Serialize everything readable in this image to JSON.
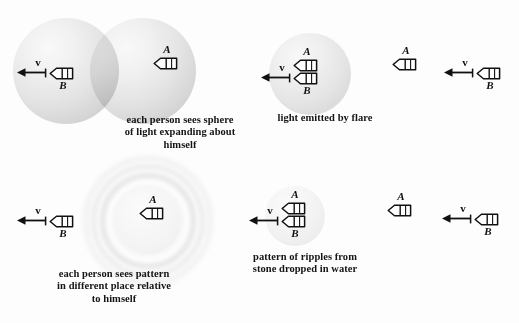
{
  "figure": {
    "background_color": "#fdfdfd",
    "ink_color": "#111111",
    "sphere_color": "#e3e3e3"
  },
  "panels": {
    "top_left": {
      "caption": "each person sees sphere\nof light expanding about\nhimself",
      "spheres": [
        {
          "name": "sphere-b",
          "cx": 66,
          "cy": 71,
          "r": 53
        },
        {
          "name": "sphere-a",
          "cx": 143,
          "cy": 71,
          "r": 53
        }
      ],
      "craft": [
        {
          "name": "craft-b",
          "label": "B",
          "label_pos": "below",
          "cx": 62,
          "cy": 73,
          "velocity": true
        },
        {
          "name": "craft-a",
          "label": "A",
          "label_pos": "above",
          "cx": 166,
          "cy": 63,
          "velocity": false
        }
      ],
      "velocity_label": "v"
    },
    "top_right": {
      "caption": "light emitted by flare",
      "spheres": [
        {
          "name": "sphere-flare",
          "cx": 310,
          "cy": 74,
          "r": 41
        }
      ],
      "craft": [
        {
          "name": "craft-a-coincident",
          "label": "A",
          "label_pos": "above",
          "cx": 306,
          "cy": 65,
          "velocity": false
        },
        {
          "name": "craft-b-coincident",
          "label": "B",
          "label_pos": "below",
          "cx": 306,
          "cy": 78,
          "velocity": true
        },
        {
          "name": "craft-a-later",
          "label": "A",
          "label_pos": "above",
          "cx": 405,
          "cy": 64,
          "velocity": false
        },
        {
          "name": "craft-b-later",
          "label": "B",
          "label_pos": "below",
          "cx": 489,
          "cy": 73,
          "velocity": true
        }
      ],
      "velocity_label": "v"
    },
    "bottom_left": {
      "caption": "each person sees pattern\nin different place relative\nto  himself",
      "ripples": {
        "name": "ripple-pattern",
        "cx": 148,
        "cy": 221,
        "radii": [
          33,
          43,
          52,
          60
        ],
        "ring_count": 4
      },
      "craft": [
        {
          "name": "craft-b-offset",
          "label": "B",
          "label_pos": "below",
          "cx": 62,
          "cy": 221,
          "velocity": true
        },
        {
          "name": "craft-a-center",
          "label": "A",
          "label_pos": "above",
          "cx": 152,
          "cy": 213,
          "velocity": false
        }
      ],
      "velocity_label": "v"
    },
    "bottom_right": {
      "caption": "pattern of ripples from\nstone dropped in water",
      "spheres": [
        {
          "name": "sphere-ripple-faint",
          "cx": 295,
          "cy": 216,
          "r": 30
        }
      ],
      "craft": [
        {
          "name": "craft-a-coincident",
          "label": "A",
          "label_pos": "above",
          "cx": 294,
          "cy": 208,
          "velocity": false
        },
        {
          "name": "craft-b-coincident",
          "label": "B",
          "label_pos": "below",
          "cx": 294,
          "cy": 221,
          "velocity": true
        },
        {
          "name": "craft-a-later",
          "label": "A",
          "label_pos": "above",
          "cx": 400,
          "cy": 210,
          "velocity": false
        },
        {
          "name": "craft-b-later",
          "label": "B",
          "label_pos": "below",
          "cx": 487,
          "cy": 219,
          "velocity": true
        }
      ],
      "velocity_label": "v"
    }
  },
  "captions": {
    "top_left": "each person sees sphere\nof light expanding about\nhimself",
    "top_right": "light emitted by flare",
    "bottom_left": "each person sees pattern\nin different place relative\nto  himself",
    "bottom_right": "pattern of ripples from\nstone dropped in water"
  },
  "labels": {
    "observer_a": "A",
    "observer_b": "B",
    "velocity": "v"
  },
  "caption_positions": {
    "top_left": {
      "cx": 180,
      "y": 114
    },
    "top_right": {
      "cx": 325,
      "y": 112
    },
    "bottom_left": {
      "cx": 114,
      "y": 268
    },
    "bottom_right": {
      "cx": 305,
      "y": 251
    }
  }
}
